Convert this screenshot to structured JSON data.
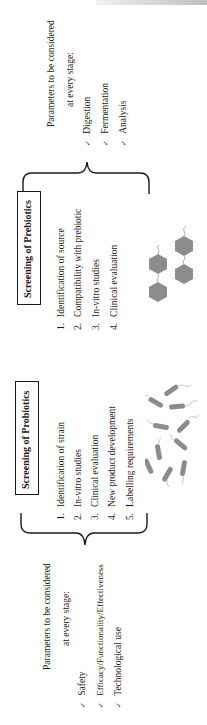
{
  "header": {
    "running_title": ""
  },
  "prebiotics": {
    "box_title": "Screening of Prebiotics",
    "steps": [
      {
        "num": "1.",
        "label": "Identification of source"
      },
      {
        "num": "2.",
        "label": "Compatibility with prebiotic"
      },
      {
        "num": "3.",
        "label": "In-vitro studies"
      },
      {
        "num": "4.",
        "label": "Clinical evaluation"
      }
    ],
    "parameters": {
      "heading_line1": "Parameters to be considered",
      "heading_line2": "at every stage:",
      "check_glyph": "✓",
      "items": [
        "Digestion",
        "Fermentation",
        "Analysis"
      ]
    },
    "illustration": "hexagon-sugar-molecules-icon"
  },
  "probiotics": {
    "box_title": "Screening of Probiotics",
    "steps": [
      {
        "num": "1.",
        "label": "Identification of strain"
      },
      {
        "num": "2.",
        "label": "In-vitro studies"
      },
      {
        "num": "3.",
        "label": "Clinical evaluation"
      },
      {
        "num": "4.",
        "label": "New product development"
      },
      {
        "num": "5.",
        "label": "Labelling requirements"
      }
    ],
    "parameters": {
      "heading_line1": "Parameters to be considered",
      "heading_line2": "at every stage:",
      "check_glyph": "✓",
      "items": [
        "Safety",
        "Efficacy/Functionality/Effectiveness",
        "Technological use"
      ]
    },
    "illustration": "rod-shaped-bacteria-icon"
  },
  "colors": {
    "ink": "#1a1a1a",
    "illustration_gray": "#8c8c8c",
    "header_gray": "#8a8a8a"
  }
}
